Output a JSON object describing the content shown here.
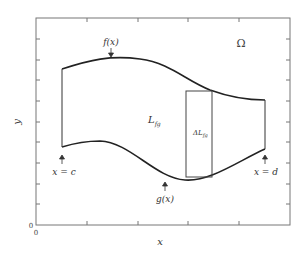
{
  "figure": {
    "axes": {
      "xlabel": "x",
      "ylabel": "y",
      "x_origin_label": "0",
      "y_origin_label": "0"
    },
    "region_label": "Ω",
    "curves": {
      "upper": {
        "label": "f(x)"
      },
      "lower": {
        "label": "g(x)"
      }
    },
    "bounds": {
      "left": {
        "label": "x = c"
      },
      "right": {
        "label": "x = d"
      }
    },
    "length_label": {
      "main": "L",
      "sub": "fg"
    },
    "strip_label": {
      "main": "ΔL",
      "sub": "fg"
    },
    "colors": {
      "frame": "#777777",
      "curve": "#222222",
      "text": "#333333"
    }
  }
}
